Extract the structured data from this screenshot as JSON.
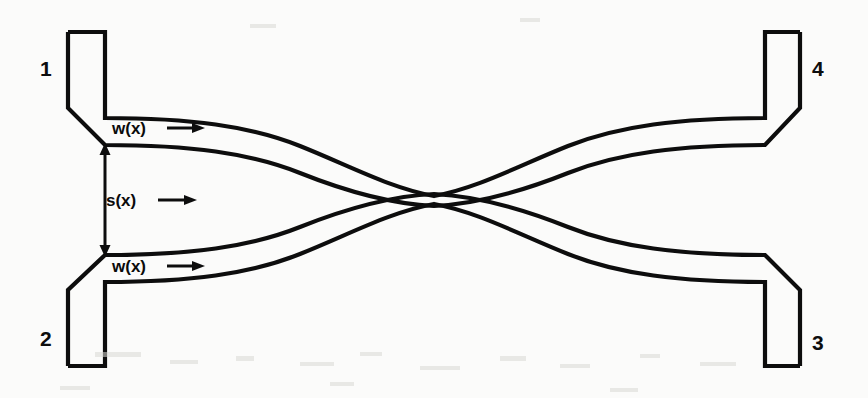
{
  "figure": {
    "type": "directional-coupler-schematic",
    "background_color": "#fbfbfa",
    "ink_color": "#0d0d0d",
    "width": 868,
    "height": 398
  },
  "ports": [
    {
      "id": "1",
      "label": "1",
      "position": "top-left"
    },
    {
      "id": "2",
      "label": "2",
      "position": "bottom-left"
    },
    {
      "id": "3",
      "label": "3",
      "position": "bottom-right"
    },
    {
      "id": "4",
      "label": "4",
      "position": "top-right"
    }
  ],
  "annotations": {
    "width_top": "w(x)",
    "width_bottom": "w(x)",
    "separation": "s(x)",
    "arrow_icon": "right-arrow-icon",
    "dimension_icon": "double-headed-vertical-arrow-icon"
  },
  "geometry": {
    "top_guide_left_outer_y": 118,
    "top_guide_left_inner_y": 145,
    "bottom_guide_left_inner_y": 255,
    "bottom_guide_left_outer_y": 282,
    "center_gap_top_y": 196,
    "center_gap_bottom_y": 206,
    "stub_left_x": 68,
    "stub_right_x": 105,
    "stub_top_y": 32,
    "stub_bottom_y": 366
  }
}
